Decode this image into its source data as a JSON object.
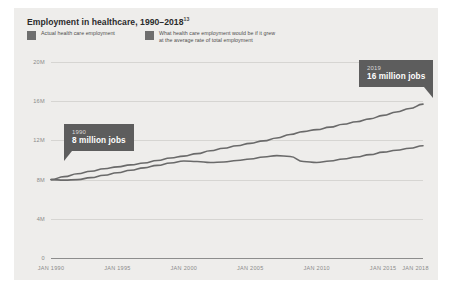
{
  "header": {
    "title": "Employment in healthcare, 1990–2018",
    "title_superscript": "13"
  },
  "legend": {
    "items": [
      {
        "label": "Actual health care employment",
        "color": "#6e6e6e"
      },
      {
        "label": "What health care employment would be if it grew\nat the average rate of total employment",
        "color": "#6e6e6e"
      }
    ]
  },
  "callouts": [
    {
      "name": "callout-1990",
      "year": "1990",
      "value": "8 million jobs"
    },
    {
      "name": "callout-2019",
      "year": "2019",
      "value": "16 million jobs"
    }
  ],
  "chart_data": {
    "type": "line",
    "title": "Employment in healthcare, 1990–2018",
    "xlabel": "",
    "ylabel": "",
    "ylim": [
      0,
      20
    ],
    "yticks": [
      0,
      4,
      8,
      12,
      16,
      20
    ],
    "ytick_labels": [
      "0",
      "4M",
      "8M",
      "12M",
      "16M",
      "20M"
    ],
    "xlim": [
      1990,
      2018
    ],
    "xticks": [
      1990,
      1995,
      2000,
      2005,
      2010,
      2015,
      2018
    ],
    "xtick_labels": [
      "JAN 1990",
      "JAN 1995",
      "JAN 2000",
      "JAN 2005",
      "JAN 2010",
      "JAN 2015",
      "JAN 2018"
    ],
    "grid": true,
    "legend_position": "top-left",
    "units": "millions of jobs",
    "series": [
      {
        "name": "Actual health care employment",
        "color": "#6a6a6a",
        "x": [
          1990,
          1991,
          1992,
          1993,
          1994,
          1995,
          1996,
          1997,
          1998,
          1999,
          2000,
          2001,
          2002,
          2003,
          2004,
          2005,
          2006,
          2007,
          2008,
          2009,
          2010,
          2011,
          2012,
          2013,
          2014,
          2015,
          2016,
          2017,
          2018
        ],
        "values": [
          8.0,
          8.3,
          8.6,
          8.85,
          9.1,
          9.3,
          9.5,
          9.7,
          9.95,
          10.2,
          10.4,
          10.65,
          10.95,
          11.2,
          11.45,
          11.7,
          11.95,
          12.25,
          12.6,
          12.9,
          13.1,
          13.35,
          13.65,
          13.9,
          14.2,
          14.55,
          14.9,
          15.25,
          15.7
        ]
      },
      {
        "name": "What health care employment would be if it grew at the average rate of total employment",
        "color": "#6a6a6a",
        "x": [
          1990,
          1991,
          1992,
          1993,
          1994,
          1995,
          1996,
          1997,
          1998,
          1999,
          2000,
          2001,
          2002,
          2003,
          2004,
          2005,
          2006,
          2007,
          2008,
          2009,
          2010,
          2011,
          2012,
          2013,
          2014,
          2015,
          2016,
          2017,
          2018
        ],
        "values": [
          8.0,
          7.95,
          8.0,
          8.2,
          8.45,
          8.7,
          8.95,
          9.2,
          9.45,
          9.7,
          9.9,
          9.85,
          9.75,
          9.8,
          9.95,
          10.1,
          10.3,
          10.45,
          10.35,
          9.85,
          9.75,
          9.9,
          10.1,
          10.3,
          10.55,
          10.8,
          11.0,
          11.2,
          11.45
        ]
      }
    ]
  }
}
